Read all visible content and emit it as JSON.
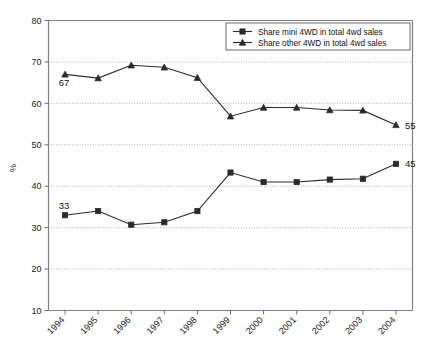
{
  "chart_data": {
    "type": "line",
    "title": "",
    "xlabel": "",
    "ylabel": "%",
    "ylim": [
      10,
      80
    ],
    "ytick_step": 10,
    "yticks": [
      10,
      20,
      30,
      40,
      50,
      60,
      70,
      80
    ],
    "grid": true,
    "legend_position": "top-right-inside",
    "categories": [
      "1994",
      "1995",
      "1996",
      "1997",
      "1998",
      "1999",
      "2000",
      "2001",
      "2002",
      "2003",
      "2004"
    ],
    "series": [
      {
        "name": "Share mini 4WD in total 4wd sales",
        "marker": "square",
        "values": [
          33,
          34,
          30.7,
          31.3,
          34,
          43.3,
          41,
          41,
          41.6,
          41.8,
          45.4
        ]
      },
      {
        "name": "Share other 4WD in total 4wd sales",
        "marker": "triangle",
        "values": [
          67,
          66.1,
          69.2,
          68.7,
          66.2,
          56.9,
          59,
          59,
          58.4,
          58.3,
          54.8
        ]
      }
    ],
    "annotations": [
      {
        "text": "67",
        "series": "Share other 4WD in total 4wd sales",
        "category": "1994",
        "position": "below-right"
      },
      {
        "text": "33",
        "series": "Share mini 4WD in total 4wd sales",
        "category": "1994",
        "position": "above-right"
      },
      {
        "text": "55",
        "series": "Share other 4WD in total 4wd sales",
        "category": "2004",
        "position": "below-right"
      },
      {
        "text": "45",
        "series": "Share mini 4WD in total 4wd sales",
        "category": "2004",
        "position": "above-right"
      }
    ],
    "colors": {
      "series_line": "#2b2b2b",
      "grid": "#9a9a9a",
      "axis": "#808080",
      "background": "#ffffff"
    }
  }
}
